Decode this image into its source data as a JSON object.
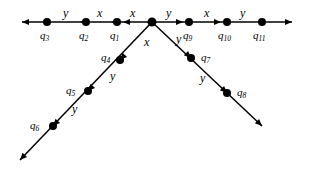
{
  "figure": {
    "type": "state-transition-diagram",
    "background_color": "#ffffff",
    "stroke_color": "#000000",
    "node_fill_color": "#000000",
    "width": 311,
    "height": 177
  },
  "nodes": [
    {
      "id": "q3",
      "label": "q",
      "sub": "3",
      "x": 47,
      "y": 22,
      "label_x": 40,
      "label_y": 30,
      "radius": 4.0
    },
    {
      "id": "q2",
      "label": "q",
      "sub": "2",
      "x": 86,
      "y": 22,
      "label_x": 79,
      "label_y": 30,
      "radius": 4.0
    },
    {
      "id": "q1",
      "label": "q",
      "sub": "1",
      "x": 117,
      "y": 22,
      "label_x": 110,
      "label_y": 30,
      "radius": 4.0
    },
    {
      "id": "center",
      "label": "",
      "sub": "",
      "x": 152,
      "y": 22,
      "label_x": 0,
      "label_y": 0,
      "radius": 4.5
    },
    {
      "id": "q9",
      "label": "q",
      "sub": "9",
      "x": 189,
      "y": 22,
      "label_x": 183,
      "label_y": 30,
      "radius": 4.0
    },
    {
      "id": "q10",
      "label": "q",
      "sub": "10",
      "x": 227,
      "y": 22,
      "label_x": 218,
      "label_y": 30,
      "radius": 4.0
    },
    {
      "id": "q11",
      "label": "q",
      "sub": "11",
      "x": 262,
      "y": 22,
      "label_x": 253,
      "label_y": 30,
      "radius": 4.0
    },
    {
      "id": "q4",
      "label": "q",
      "sub": "4",
      "x": 120,
      "y": 60,
      "label_x": 101,
      "label_y": 52,
      "radius": 4.0
    },
    {
      "id": "q5",
      "label": "q",
      "sub": "5",
      "x": 88,
      "y": 91,
      "label_x": 66,
      "label_y": 85,
      "radius": 4.0
    },
    {
      "id": "q6",
      "label": "q",
      "sub": "6",
      "x": 53,
      "y": 126,
      "label_x": 30,
      "label_y": 120,
      "radius": 4.0
    },
    {
      "id": "q7",
      "label": "q",
      "sub": "7",
      "x": 191,
      "y": 58,
      "label_x": 201,
      "label_y": 52,
      "radius": 4.0
    },
    {
      "id": "q8",
      "label": "q",
      "sub": "8",
      "x": 227,
      "y": 93,
      "label_x": 237,
      "label_y": 87,
      "radius": 4.0
    }
  ],
  "edges": [
    {
      "from": "q3",
      "to": "q2",
      "label": "y",
      "label_x": 63,
      "label_y": 7
    },
    {
      "from": "q2",
      "to": "q1",
      "label": "x",
      "label_x": 97,
      "label_y": 7
    },
    {
      "from": "q1",
      "to": "center",
      "label": "x",
      "label_x": 130,
      "label_y": 7
    },
    {
      "from": "center",
      "to": "q9",
      "label": "y",
      "label_x": 166,
      "label_y": 7
    },
    {
      "from": "q9",
      "to": "q10",
      "label": "x",
      "label_x": 204,
      "label_y": 7
    },
    {
      "from": "q10",
      "to": "q11",
      "label": "y",
      "label_x": 240,
      "label_y": 7
    },
    {
      "from": "center",
      "to": "q4",
      "label": "x",
      "label_x": 144,
      "label_y": 36
    },
    {
      "from": "q4",
      "to": "q5",
      "label": "y",
      "label_x": 110,
      "label_y": 70
    },
    {
      "from": "q5",
      "to": "q6",
      "label": "y",
      "label_x": 72,
      "label_y": 103
    },
    {
      "from": "center",
      "to": "q7",
      "label": "y",
      "label_x": 176,
      "label_y": 33
    },
    {
      "from": "q7",
      "to": "q8",
      "label": "y",
      "label_x": 200,
      "label_y": 72
    }
  ],
  "arrowheads": [
    {
      "name": "left-terminal-arrow",
      "at_x": 22,
      "at_y": 22,
      "direction": "left"
    },
    {
      "name": "right-terminal-arrow",
      "at_x": 292,
      "at_y": 22,
      "direction": "right"
    },
    {
      "name": "bottom-left-terminal-arrow",
      "at_x": 20,
      "at_y": 160,
      "direction": "down-left"
    },
    {
      "name": "bottom-right-terminal-arrow",
      "at_x": 262,
      "at_y": 126,
      "direction": "down-right"
    },
    {
      "name": "mid-arrow-q3-q2",
      "at_x": 80,
      "at_y": 22,
      "direction": "left"
    },
    {
      "name": "mid-arrow-q2-q1",
      "at_x": 111,
      "at_y": 22,
      "direction": "left"
    },
    {
      "name": "mid-arrow-q1-ctr",
      "at_x": 123,
      "at_y": 22,
      "direction": "left"
    },
    {
      "name": "mid-arrow-ctr-q9",
      "at_x": 183,
      "at_y": 22,
      "direction": "right"
    },
    {
      "name": "mid-arrow-q9-q10",
      "at_x": 221,
      "at_y": 22,
      "direction": "right"
    },
    {
      "name": "mid-arrow-q4",
      "at_x": 120,
      "at_y": 60,
      "direction": "down-left"
    },
    {
      "name": "mid-arrow-q5",
      "at_x": 88,
      "at_y": 91,
      "direction": "down-left"
    },
    {
      "name": "mid-arrow-q6",
      "at_x": 53,
      "at_y": 126,
      "direction": "down-left"
    },
    {
      "name": "mid-arrow-q7",
      "at_x": 191,
      "at_y": 58,
      "direction": "down-right"
    },
    {
      "name": "mid-arrow-q8",
      "at_x": 227,
      "at_y": 93,
      "direction": "down-right"
    }
  ],
  "lines": [
    {
      "name": "horizontal-axis-line",
      "x1": 22,
      "y1": 22,
      "x2": 292,
      "y2": 22
    },
    {
      "name": "left-branch-line",
      "x1": 152,
      "y1": 22,
      "x2": 20,
      "y2": 160
    },
    {
      "name": "right-branch-line",
      "x1": 152,
      "y1": 22,
      "x2": 262,
      "y2": 126
    }
  ]
}
